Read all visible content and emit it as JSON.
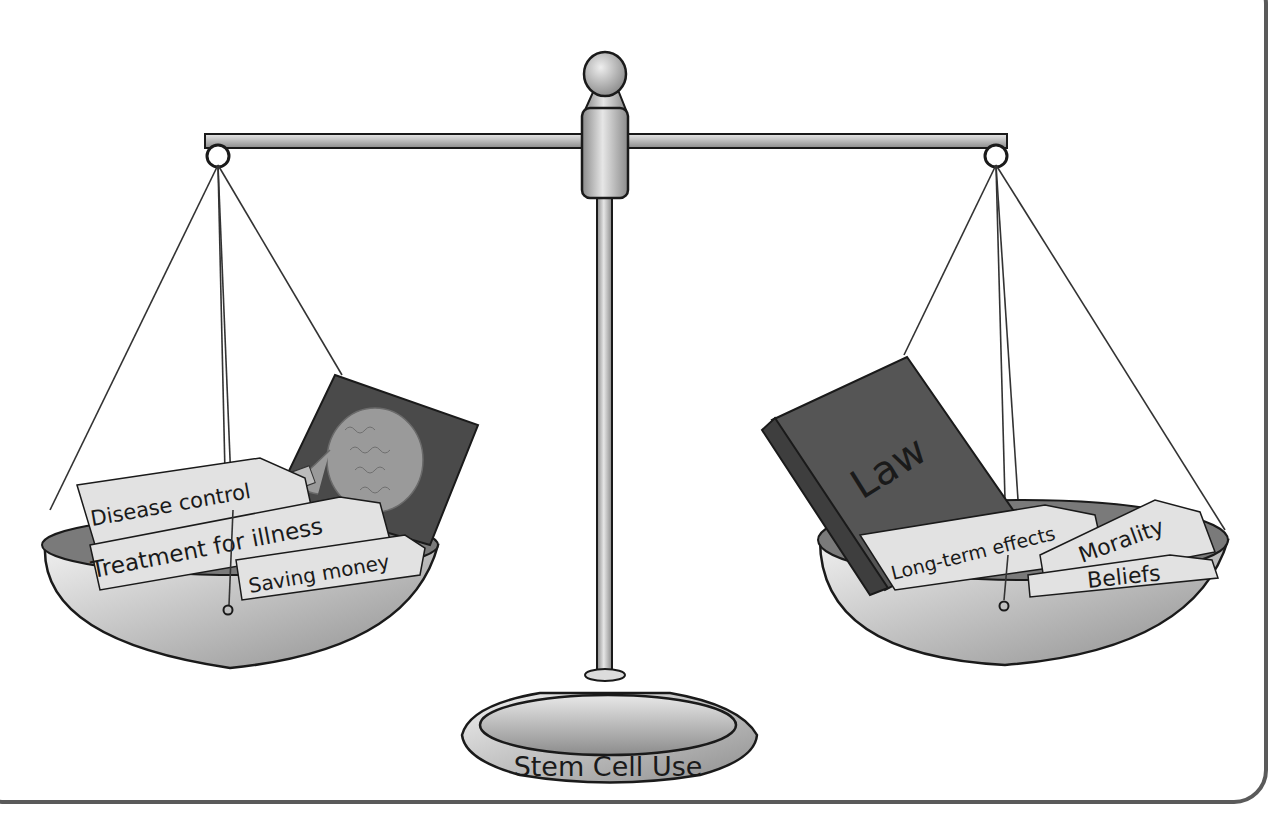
{
  "figure": {
    "base_label": "Stem Cell Use",
    "left_pan": {
      "items": [
        "Disease control",
        "Treatment for illness",
        "Saving money"
      ],
      "image": "skull-brain-xray"
    },
    "right_pan": {
      "book_label": "Law",
      "items": [
        "Long-term effects",
        "Morality",
        "Beliefs"
      ]
    }
  },
  "colors": {
    "outline": "#1a1a1a",
    "metal_light": "#e6e6e6",
    "metal_mid": "#a8a8a8",
    "paper": "#e2e2e2",
    "book": "#555555",
    "book_spine": "#3e3e3e",
    "xray_bg": "#4a4a4a",
    "skull": "#9a9a9a",
    "frame": "#5a5a5a"
  }
}
